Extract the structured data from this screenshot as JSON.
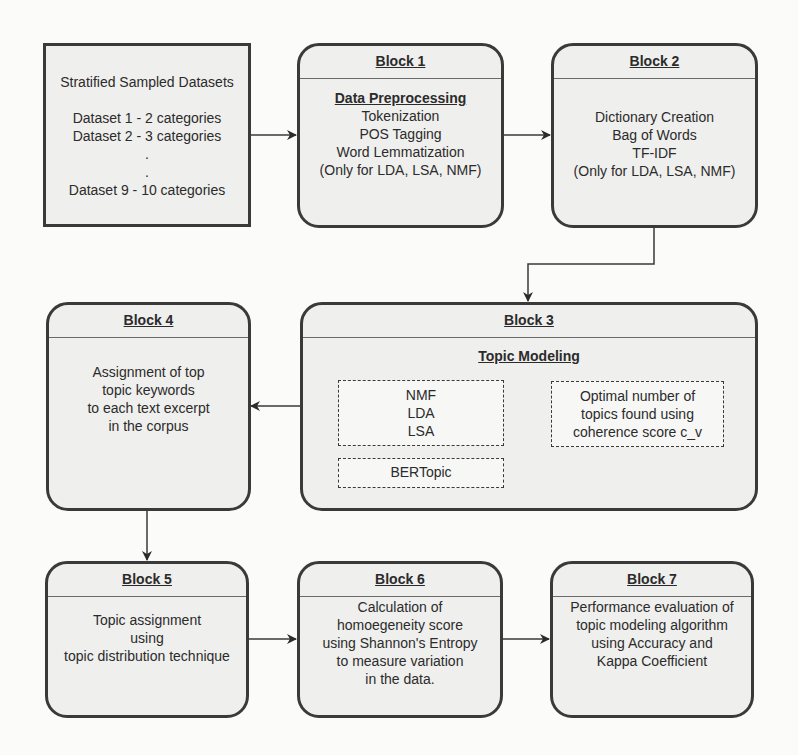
{
  "source": {
    "title": "Stratified Sampled Datasets",
    "items": [
      "Dataset 1 - 2 categories",
      "Dataset 2 - 3 categories",
      ".",
      ".",
      "Dataset 9 - 10 categories"
    ]
  },
  "blocks": {
    "b1": {
      "header": "Block 1",
      "subtitle": "Data Preprocessing",
      "lines": [
        "Tokenization",
        "POS Tagging",
        "Word Lemmatization",
        "(Only for LDA, LSA, NMF)"
      ]
    },
    "b2": {
      "header": "Block 2",
      "lines": [
        "Dictionary Creation",
        "Bag of Words",
        "TF-IDF",
        "(Only for LDA, LSA, NMF)"
      ]
    },
    "b3": {
      "header": "Block 3",
      "subtitle": "Topic Modeling",
      "models": [
        "NMF",
        "LDA",
        "LSA"
      ],
      "bertopic": "BERTopic",
      "optimal": [
        "Optimal number of",
        "topics found using",
        "coherence score c_v"
      ]
    },
    "b4": {
      "header": "Block 4",
      "lines": [
        "Assignment of top",
        "topic keywords",
        "to each text excerpt",
        "in the corpus"
      ]
    },
    "b5": {
      "header": "Block 5",
      "lines": [
        "Topic assignment",
        "using",
        "topic distribution technique"
      ]
    },
    "b6": {
      "header": "Block 6",
      "lines": [
        "Calculation of",
        "homoegeneity score",
        "using Shannon's Entropy",
        "to measure variation",
        "in the data."
      ]
    },
    "b7": {
      "header": "Block 7",
      "lines": [
        "Performance evaluation of",
        "topic modeling algorithm",
        "using Accuracy and",
        "Kappa Coefficient"
      ]
    }
  },
  "colors": {
    "stroke": "#3a3a3a",
    "fill": "#efefed",
    "background": "#fbfbfa"
  }
}
